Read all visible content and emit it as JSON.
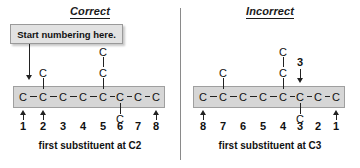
{
  "figure": {
    "title_left": "Correct",
    "title_right": "Incorrect"
  },
  "callout": {
    "text": "Start numbering here."
  },
  "chain": {
    "atom_label": "C",
    "length": 8
  },
  "left_panel": {
    "heading": "Correct",
    "caption": "first substituent at C2",
    "numbers": [
      "1",
      "2",
      "3",
      "4",
      "5",
      "6",
      "7",
      "8"
    ],
    "main_chain": [
      "C",
      "C",
      "C",
      "C",
      "C",
      "C",
      "C",
      "C"
    ],
    "substituents": [
      {
        "position": 2,
        "direction": "up",
        "atoms": [
          "C"
        ]
      },
      {
        "position": 5,
        "direction": "up",
        "atoms": [
          "C",
          "C"
        ]
      },
      {
        "position": 6,
        "direction": "down",
        "atoms": [
          "C"
        ]
      }
    ],
    "arrows": [
      {
        "target_position": 1,
        "label": "",
        "from": "callout"
      },
      {
        "target_position": 2,
        "label": ""
      },
      {
        "target_position": 8,
        "label": ""
      }
    ]
  },
  "right_panel": {
    "heading": "Incorrect",
    "caption": "first substituent at C3",
    "numbers": [
      "8",
      "7",
      "6",
      "5",
      "4",
      "3",
      "2",
      "1"
    ],
    "main_chain": [
      "C",
      "C",
      "C",
      "C",
      "C",
      "C",
      "C",
      "C"
    ],
    "substituents": [
      {
        "position": 2,
        "direction": "up",
        "atoms": [
          "C"
        ]
      },
      {
        "position": 5,
        "direction": "up",
        "atoms": [
          "C",
          "C"
        ]
      },
      {
        "position": 6,
        "direction": "down",
        "atoms": [
          "C"
        ]
      }
    ],
    "arrows": [
      {
        "target_position": 1,
        "label": ""
      },
      {
        "target_position": 6,
        "label": "3"
      },
      {
        "target_position": 8,
        "label": ""
      }
    ]
  },
  "colors": {
    "band_fill": "#d6d6d6",
    "band_border": "#9f9f9f",
    "callout_fill": "#e2e2e2",
    "callout_border": "#9a9a9a",
    "ink": "#111111",
    "divider": "#8a8a8a"
  }
}
